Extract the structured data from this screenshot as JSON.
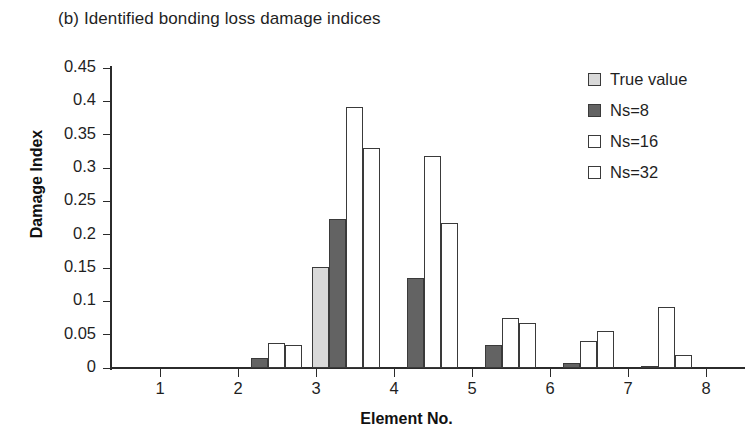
{
  "chart_data": {
    "type": "bar",
    "title": "(b) Identified bonding loss damage indices",
    "xlabel": "Element No.",
    "ylabel": "Damage Index",
    "categories": [
      "1",
      "2",
      "3",
      "4",
      "5",
      "6",
      "7",
      "8"
    ],
    "ylim": [
      0,
      0.45
    ],
    "yticks": [
      0,
      0.05,
      0.1,
      0.15,
      0.2,
      0.25,
      0.3,
      0.35,
      0.4,
      0.45
    ],
    "ytick_labels": [
      "0",
      "0.05",
      "0.1",
      "0.15",
      "0.2",
      "0.25",
      "0.3",
      "0.35",
      "0.4",
      "0.45"
    ],
    "grid": false,
    "legend_position": "top-right",
    "series": [
      {
        "name": "True value",
        "color": "#d9d9d9",
        "edge_color": "#3a3a3a",
        "values": [
          0,
          0,
          0.151,
          0,
          0,
          0,
          0,
          0
        ]
      },
      {
        "name": "Ns=8",
        "color": "#636363",
        "edge_color": "#3a3a3a",
        "values": [
          0,
          0.015,
          0.224,
          0.135,
          0.035,
          0.008,
          0.003,
          0
        ]
      },
      {
        "name": "Ns=16",
        "color": "#ffffff",
        "edge_color": "#3a3a3a",
        "values": [
          0,
          0.038,
          0.392,
          0.318,
          0.075,
          0.04,
          0.091,
          0
        ]
      },
      {
        "name": "Ns=32",
        "color": "#ffffff",
        "edge_color": "#3a3a3a",
        "values": [
          0,
          0.035,
          0.33,
          0.218,
          0.068,
          0.055,
          0.02,
          0.024
        ]
      }
    ]
  },
  "legend": {
    "items": [
      {
        "label": "True value",
        "swatch": "#d9d9d9"
      },
      {
        "label": "Ns=8",
        "swatch": "#636363"
      },
      {
        "label": "Ns=16",
        "swatch": "#ffffff"
      },
      {
        "label": "Ns=32",
        "swatch": "#ffffff"
      }
    ]
  }
}
